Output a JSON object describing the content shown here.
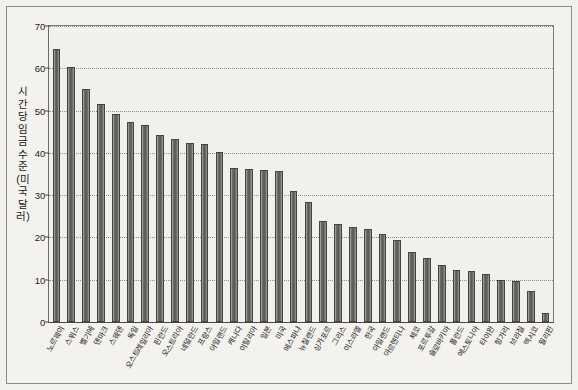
{
  "chart_data": {
    "type": "bar",
    "title": "",
    "xlabel": "",
    "ylabel": "시간당 임금 수준(미국 달러)",
    "ylim": [
      0,
      70
    ],
    "ytick_values": [
      70,
      60,
      50,
      40,
      30,
      20,
      10,
      0
    ],
    "ytick_labels": [
      "70",
      "60",
      "50",
      "40",
      "30",
      "20",
      "10",
      "0"
    ],
    "grid": true,
    "legend": "none",
    "bar_color": "#6f6d69",
    "categories": [
      "노르웨이",
      "스위스",
      "벨기에",
      "덴마크",
      "스웨덴",
      "독일",
      "오스트레일리아",
      "핀란드",
      "오스트리아",
      "네덜란드",
      "프랑스",
      "아일랜드",
      "캐나다",
      "이탈리아",
      "일본",
      "미국",
      "에스파냐",
      "뉴질랜드",
      "싱가포르",
      "그리스",
      "이스라엘",
      "한국",
      "아일랜드",
      "아르헨티나",
      "체코",
      "포르투갈",
      "슬로바키아",
      "폴란드",
      "에스토니아",
      "타이완",
      "헝가리",
      "브라질",
      "멕시코",
      "필리핀"
    ],
    "values": [
      64.5,
      60.2,
      55.0,
      51.5,
      49.2,
      47.4,
      46.5,
      44.3,
      43.2,
      42.4,
      42.2,
      40.1,
      36.5,
      36.1,
      36.0,
      35.6,
      30.9,
      28.4,
      23.8,
      23.1,
      22.4,
      22.1,
      20.8,
      19.5,
      16.6,
      15.2,
      13.4,
      12.4,
      12.1,
      11.4,
      10.0,
      9.8,
      7.4,
      2.2
    ]
  },
  "axis": {
    "y_label_text": "시간당 임금 수준(미국 달러)"
  }
}
